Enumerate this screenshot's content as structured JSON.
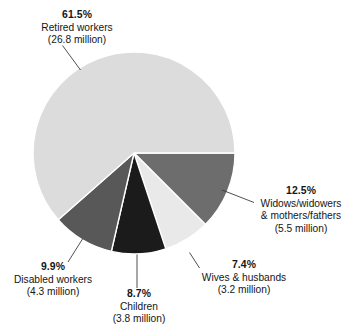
{
  "chart_data": {
    "type": "pie",
    "title": "",
    "subtitle": "",
    "xlabel": "",
    "ylabel": "",
    "grid": false,
    "legend_position": "callout-labels",
    "total_label": "",
    "units": "million",
    "start_angle_deg": 0,
    "direction": "clockwise",
    "categories": [
      "Widows/widowers & mothers/fathers",
      "Wives & husbands",
      "Children",
      "Disabled workers",
      "Retired workers"
    ],
    "values": [
      12.5,
      7.4,
      8.7,
      9.9,
      61.5
    ],
    "amounts": [
      5.5,
      3.2,
      3.8,
      4.3,
      26.8
    ],
    "slices": [
      {
        "key": "widows",
        "percent_label": "12.5%",
        "name_line_1": "Widows/widowers",
        "name_line_2": "& mothers/fathers",
        "amount_label": "(5.5 million)",
        "percent": 12.5,
        "amount_millions": 5.5,
        "color": "#6d6d6d"
      },
      {
        "key": "wives",
        "percent_label": "7.4%",
        "name_line_1": "Wives & husbands",
        "name_line_2": "",
        "amount_label": "(3.2 million)",
        "percent": 7.4,
        "amount_millions": 3.2,
        "color": "#e9e9e9"
      },
      {
        "key": "children",
        "percent_label": "8.7%",
        "name_line_1": "Children",
        "name_line_2": "",
        "amount_label": "(3.8 million)",
        "percent": 8.7,
        "amount_millions": 3.8,
        "color": "#1b1b1b"
      },
      {
        "key": "disabled",
        "percent_label": "9.9%",
        "name_line_1": "Disabled workers",
        "name_line_2": "",
        "amount_label": "(4.3 million)",
        "percent": 9.9,
        "amount_millions": 4.3,
        "color": "#585858"
      },
      {
        "key": "retired",
        "percent_label": "61.5%",
        "name_line_1": "Retired workers",
        "name_line_2": "",
        "amount_label": "(26.8 million)",
        "percent": 61.5,
        "amount_millions": 26.8,
        "color": "#dcdcdc"
      }
    ]
  },
  "colors": {
    "background": "#ffffff",
    "text": "#151515",
    "leader_line": "#3c3c3c",
    "slice_divider": "#ffffff",
    "retired": "#dcdcdc",
    "widows": "#6d6d6d",
    "wives": "#e9e9e9",
    "children": "#1b1b1b",
    "disabled": "#585858"
  },
  "geometry": {
    "center_x": 134,
    "center_y": 153,
    "radius": 101
  }
}
